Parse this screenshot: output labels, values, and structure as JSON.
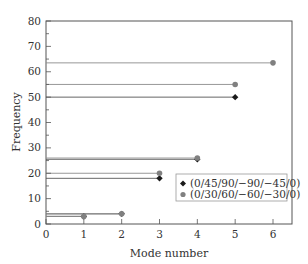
{
  "chart_data": {
    "type": "scatter",
    "title": "",
    "xlabel": "Mode number",
    "ylabel": "Frequency",
    "xlim": [
      0,
      6.5
    ],
    "ylim": [
      0,
      80
    ],
    "xticks": [
      0,
      1,
      2,
      3,
      4,
      5,
      6
    ],
    "yticks": [
      0,
      10,
      20,
      30,
      40,
      50,
      60,
      70,
      80
    ],
    "grid": false,
    "legend_position": "lower right (inside)",
    "reference_lines": "horizontal lines drawn from the y-axis to each data point",
    "series": [
      {
        "name": "(0/45/90/−90/−45/0)",
        "marker": "diamond",
        "color": "#1a1a1a",
        "x": [
          1,
          2,
          3,
          4,
          5
        ],
        "y": [
          3,
          4,
          18,
          25.5,
          50
        ]
      },
      {
        "name": "(0/30/60/−60/−30/0)",
        "marker": "circle",
        "color": "#808080",
        "x": [
          1,
          2,
          3,
          4,
          5,
          6
        ],
        "y": [
          3,
          4,
          20,
          26,
          55,
          63.5
        ]
      }
    ]
  },
  "labels": {
    "xlabel": "Mode number",
    "ylabel": "Frequency",
    "xticks": [
      "0",
      "1",
      "2",
      "3",
      "4",
      "5",
      "6"
    ],
    "yticks": [
      "0",
      "10",
      "20",
      "30",
      "40",
      "50",
      "60",
      "70",
      "80"
    ],
    "legend": [
      "(0/45/90/−90/−45/0)",
      "(0/30/60/−60/−30/0)"
    ]
  }
}
